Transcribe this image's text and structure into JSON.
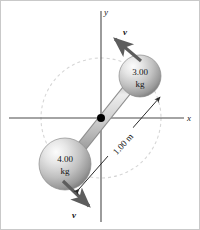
{
  "figure": {
    "name": "rotating-dumbbell-diagram",
    "background": "#ffffff",
    "border_color": "#c9c9c9",
    "width": 200,
    "height": 230
  },
  "axes": {
    "x_label": "x",
    "y_label": "y",
    "color": "#4a4a4a",
    "origin": {
      "x": 100,
      "y": 117
    },
    "x_start": {
      "x": 8,
      "y": 117
    },
    "x_end": {
      "x": 183,
      "y": 117
    },
    "y_start": {
      "x": 100,
      "y": 10
    },
    "y_end": {
      "x": 100,
      "y": 221
    }
  },
  "orbit_circle": {
    "name": "dashed-orbit-circle",
    "center_x": 100,
    "center_y": 117,
    "radius": 60,
    "color": "#d2d2d2",
    "dash": "3 3"
  },
  "rod": {
    "name": "connecting-rod",
    "color_light": "#e2e2e2",
    "color_mid": "#a8a8a8",
    "color_dark": "#8c8c8c",
    "thickness": 9,
    "from": {
      "x": 66,
      "y": 164
    },
    "to": {
      "x": 138,
      "y": 74
    }
  },
  "pivot": {
    "name": "center-pivot-dot",
    "x": 100,
    "y": 117,
    "radius": 4,
    "color": "#000000"
  },
  "spheres": [
    {
      "name": "sphere-3kg",
      "value": "3.00",
      "unit": "kg",
      "cx": 139,
      "cy": 75,
      "r": 21,
      "fill_light": "#f2f2f2",
      "fill_mid": "#c4c4c4",
      "fill_dark": "#8f8f8f"
    },
    {
      "name": "sphere-4kg",
      "value": "4.00",
      "unit": "kg",
      "cx": 64,
      "cy": 163,
      "r": 26,
      "fill_light": "#f2f2f2",
      "fill_mid": "#c4c4c4",
      "fill_dark": "#8f8f8f"
    }
  ],
  "velocity_vectors": [
    {
      "name": "velocity-arrow-top",
      "label": "v",
      "from": {
        "x": 140,
        "y": 60
      },
      "to": {
        "x": 112,
        "y": 36
      },
      "label_x": 122,
      "label_y": 33,
      "color": "#5d5d5d"
    },
    {
      "name": "velocity-arrow-bottom",
      "label": "v",
      "from": {
        "x": 62,
        "y": 180
      },
      "to": {
        "x": 90,
        "y": 207
      },
      "label_x": 73,
      "label_y": 215,
      "color": "#5d5d5d"
    }
  ],
  "dimension": {
    "name": "length-dimension-line",
    "label": "1.00 m",
    "from": {
      "x": 76,
      "y": 190
    },
    "to": {
      "x": 161,
      "y": 94
    },
    "label_x": 122,
    "label_y": 143,
    "label_rotation": -48,
    "color": "#2a2a2a"
  }
}
